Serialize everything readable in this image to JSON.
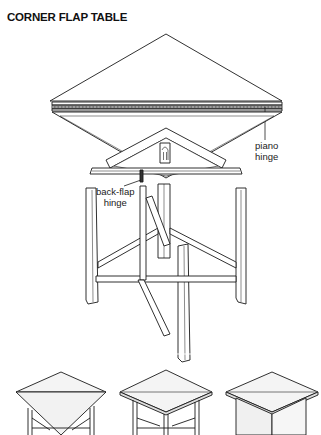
{
  "title": "CORNER FLAP TABLE",
  "labels": {
    "piano_hinge": [
      "piano",
      "hinge"
    ],
    "back_flap_hinge": [
      "back-flap",
      "hinge"
    ]
  },
  "views": {
    "exploded": "exploded view",
    "thumbnails": [
      "flap open",
      "flap half folded",
      "flap closed"
    ]
  },
  "colors": {
    "line": "#1a1a1a",
    "fill": "#ffffff",
    "shade": "#eeeeee",
    "hinge": "#6a6a6a"
  }
}
